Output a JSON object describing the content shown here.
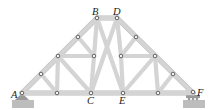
{
  "diagram": {
    "type": "roof truss",
    "labels": {
      "A": "A",
      "B": "B",
      "C": "C",
      "D": "D",
      "E": "E",
      "F": "F"
    },
    "supports": {
      "left": "pin support at A",
      "right": "roller support at F"
    },
    "colors": {
      "member": "#d4d4d4",
      "pin": "#555555",
      "support": "#9a9a9a"
    }
  }
}
